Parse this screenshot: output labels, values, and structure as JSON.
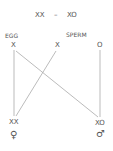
{
  "title": {
    "left": "XX",
    "dash": "–",
    "right": "XO"
  },
  "parents": {
    "egg_label": "EGG",
    "sperm_label": "SPERM"
  },
  "gametes": {
    "egg": "X",
    "sperm_x": "X",
    "sperm_o": "O"
  },
  "offspring": {
    "female": {
      "genotype": "XX",
      "symbol": "♀"
    },
    "male": {
      "genotype": "XO",
      "symbol": "♂"
    }
  },
  "colors": {
    "text": "#555555",
    "line": "#aaaaaa"
  }
}
